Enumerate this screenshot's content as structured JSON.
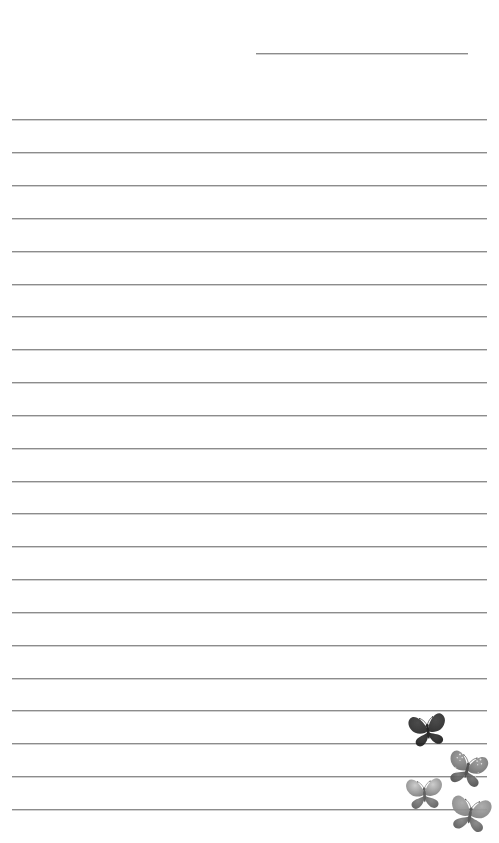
{
  "page": {
    "width": 499,
    "height": 843,
    "background_color": "#ffffff",
    "kind": "lined-stationery-sheet"
  },
  "rules": {
    "line_color": "#8c8c8c",
    "left_margin": 12,
    "right_margin": 12,
    "line_spacing": 32.9,
    "count": 23,
    "items": [
      {
        "name": "header-rule",
        "x": 256,
        "y": 53,
        "width": 212,
        "short": true
      },
      {
        "name": "rule-1",
        "x": 12,
        "y": 119,
        "width": 475,
        "short": false
      },
      {
        "name": "rule-2",
        "x": 12,
        "y": 152,
        "width": 475,
        "short": false
      },
      {
        "name": "rule-3",
        "x": 12,
        "y": 185,
        "width": 475,
        "short": false
      },
      {
        "name": "rule-4",
        "x": 12,
        "y": 218,
        "width": 475,
        "short": false
      },
      {
        "name": "rule-5",
        "x": 12,
        "y": 251,
        "width": 475,
        "short": false
      },
      {
        "name": "rule-6",
        "x": 12,
        "y": 284,
        "width": 475,
        "short": false
      },
      {
        "name": "rule-7",
        "x": 12,
        "y": 316,
        "width": 475,
        "short": false
      },
      {
        "name": "rule-8",
        "x": 12,
        "y": 349,
        "width": 475,
        "short": false
      },
      {
        "name": "rule-9",
        "x": 12,
        "y": 382,
        "width": 475,
        "short": false
      },
      {
        "name": "rule-10",
        "x": 12,
        "y": 415,
        "width": 475,
        "short": false
      },
      {
        "name": "rule-11",
        "x": 12,
        "y": 448,
        "width": 475,
        "short": false
      },
      {
        "name": "rule-12",
        "x": 12,
        "y": 481,
        "width": 475,
        "short": false
      },
      {
        "name": "rule-13",
        "x": 12,
        "y": 513,
        "width": 475,
        "short": false
      },
      {
        "name": "rule-14",
        "x": 12,
        "y": 546,
        "width": 475,
        "short": false
      },
      {
        "name": "rule-15",
        "x": 12,
        "y": 579,
        "width": 475,
        "short": false
      },
      {
        "name": "rule-16",
        "x": 12,
        "y": 612,
        "width": 475,
        "short": false
      },
      {
        "name": "rule-17",
        "x": 12,
        "y": 645,
        "width": 475,
        "short": false
      },
      {
        "name": "rule-18",
        "x": 12,
        "y": 678,
        "width": 475,
        "short": false
      },
      {
        "name": "rule-19",
        "x": 12,
        "y": 710,
        "width": 475,
        "short": false
      },
      {
        "name": "rule-20",
        "x": 12,
        "y": 743,
        "width": 475,
        "short": false
      },
      {
        "name": "rule-21",
        "x": 12,
        "y": 776,
        "width": 475,
        "short": false
      },
      {
        "name": "rule-22",
        "x": 12,
        "y": 809,
        "width": 475,
        "short": false
      }
    ]
  },
  "decorations": {
    "type": "butterflies",
    "count": 4,
    "cluster_position": "bottom-right",
    "items": [
      {
        "name": "butterfly-dark-charcoal",
        "x": 405,
        "y": 708,
        "size": 46,
        "rotation": -8,
        "upper_wing_color": "#3e3e3e",
        "lower_wing_color": "#2b2b2b",
        "body_color": "#1c1c1c",
        "spots": false,
        "opacity": 0.95
      },
      {
        "name": "butterfly-spotted-gray",
        "x": 443,
        "y": 746,
        "size": 48,
        "rotation": 14,
        "upper_wing_color": "#9a9a9a",
        "lower_wing_color": "#6f6f6f",
        "body_color": "#4a4a4a",
        "spots": true,
        "opacity": 0.95
      },
      {
        "name": "butterfly-light-gray",
        "x": 402,
        "y": 772,
        "size": 45,
        "rotation": -3,
        "upper_wing_color": "#c9c9c9",
        "lower_wing_color": "#7c7c7c",
        "body_color": "#5a5a5a",
        "spots": false,
        "opacity": 0.95
      },
      {
        "name": "butterfly-medium-gray",
        "x": 445,
        "y": 790,
        "size": 50,
        "rotation": 10,
        "upper_wing_color": "#a8a8a8",
        "lower_wing_color": "#818181",
        "body_color": "#565656",
        "spots": false,
        "opacity": 0.95
      }
    ]
  }
}
